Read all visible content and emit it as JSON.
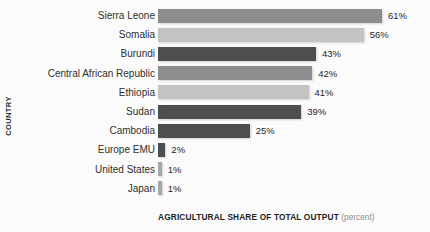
{
  "chart_data": {
    "type": "bar",
    "orientation": "horizontal",
    "title": "",
    "xlabel": "AGRICULTURAL SHARE OF TOTAL OUTPUT",
    "xlabel_unit": "(percent)",
    "ylabel": "COUNTRY",
    "grid": false,
    "legend": "none",
    "xlim": [
      0,
      61
    ],
    "categories": [
      "Sierra Leone",
      "Somalia",
      "Burundi",
      "Central African Republic",
      "Ethiopia",
      "Sudan",
      "Cambodia",
      "Europe EMU",
      "United States",
      "Japan"
    ],
    "values": [
      61,
      56,
      43,
      42,
      41,
      39,
      25,
      2,
      1,
      1
    ],
    "value_labels": [
      "61%",
      "56%",
      "43%",
      "42%",
      "41%",
      "39%",
      "25%",
      "2%",
      "1%",
      "1%"
    ],
    "bar_colors": [
      "#8d8d8d",
      "#c3c3c3",
      "#4e4e4e",
      "#8d8d8d",
      "#c3c3c3",
      "#4e4e4e",
      "#4e4e4e",
      "#4e4e4e",
      "#a8a8a8",
      "#a8a8a8"
    ]
  },
  "colors": {
    "background": "#fbfbfb",
    "label_text": "#2f2f2f",
    "value_text": "#262626",
    "axis_title": "#1f1f1f",
    "unit_text": "#8d8d8d"
  }
}
